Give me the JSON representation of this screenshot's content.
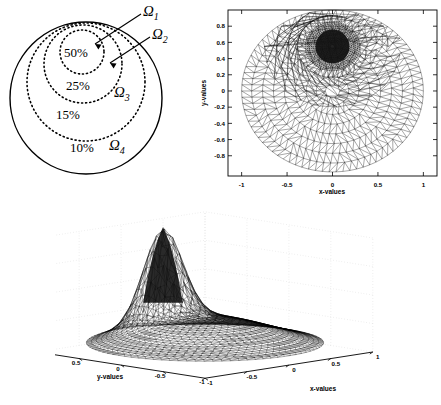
{
  "figure": {
    "panels": [
      "schematic-subdomains",
      "adaptive-mesh-2d",
      "solution-surface-3d"
    ]
  },
  "schematic": {
    "regions": [
      {
        "name": "Ω",
        "sub": "1",
        "percent": "50%"
      },
      {
        "name": "Ω",
        "sub": "2",
        "percent": "25%"
      },
      {
        "name": "Ω",
        "sub": "3",
        "percent": "15%"
      },
      {
        "name": "Ω",
        "sub": "4",
        "percent": "10%"
      }
    ],
    "labels": {
      "omega1": "Ω",
      "omega1_sub": "1",
      "omega2": "Ω",
      "omega2_sub": "2",
      "omega3": "Ω",
      "omega3_sub": "3",
      "omega4": "Ω",
      "omega4_sub": "4",
      "pct1": "50%",
      "pct2": "25%",
      "pct3": "15%",
      "pct4": "10%"
    }
  },
  "chart_data": [
    {
      "type": "scatter",
      "id": "adaptive-mesh-2d",
      "title": "",
      "xlabel": "x-values",
      "ylabel": "y-values",
      "xlim": [
        -1.15,
        1.15
      ],
      "ylim": [
        -1.05,
        1.0
      ],
      "xticks": [
        -1,
        -0.5,
        0,
        0.5,
        1
      ],
      "xticklabels": [
        "-1",
        "-0.5",
        "0",
        "0.5",
        "1"
      ],
      "yticks": [
        0.8,
        0.6,
        0.4,
        0.2,
        0,
        -0.2,
        -0.4,
        -0.6,
        -0.8
      ],
      "yticklabels": [
        "0.8",
        "0.6",
        "0.4",
        "0.2",
        "0",
        "-0.2",
        "-0.4",
        "-0.6",
        "-0.8"
      ],
      "grid": false,
      "domain": "unit disk, radius 1 centred at (0,0)",
      "refinement_center": [
        0.0,
        0.55
      ],
      "refinement_radius": 0.3,
      "description": "Triangular finite-element mesh on the unit disk with strong local refinement in the upper-central region"
    },
    {
      "type": "area",
      "id": "solution-surface-3d",
      "title": "",
      "xlabel": "x-values",
      "ylabel": "y-values",
      "zlabel": "",
      "xlim": [
        -1,
        1
      ],
      "ylim": [
        -1,
        1
      ],
      "zlim": [
        0,
        2
      ],
      "xticks": [
        -1,
        -0.5,
        0,
        0.5,
        1
      ],
      "xticklabels": [
        "-1",
        "-0.5",
        "0",
        "0.5",
        "1"
      ],
      "yticks": [
        1,
        0.5,
        0,
        -0.5,
        -1
      ],
      "yticklabels": [
        "1",
        "0.5",
        "0",
        "-0.5",
        "-1"
      ],
      "zticks": [
        0,
        0.5,
        1,
        1.5,
        2
      ],
      "zticklabels": [
        "0",
        "0.5",
        "1",
        "1.5",
        "2"
      ],
      "grid": true,
      "peak_value": 2.0,
      "peak_location": [
        0.0,
        0.5
      ],
      "description": "Triangulated surface mesh of the solution over the unit disk, rising to a sharp peak of about 2"
    }
  ]
}
